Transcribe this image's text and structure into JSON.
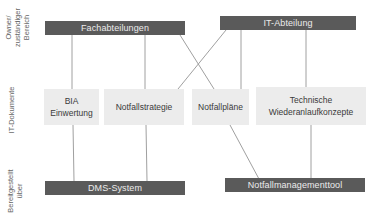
{
  "side_labels": {
    "owner": [
      "Owner/",
      "zuständiger",
      "Bereich"
    ],
    "documents": "IT-Dokumente",
    "provided": [
      "Bereitgestellt",
      "über"
    ]
  },
  "owners": {
    "fachabteilungen": "Fachabteilungen",
    "it_abteilung": "IT-Abteilung"
  },
  "documents": {
    "bia": [
      "BIA",
      "Einwertung"
    ],
    "notfallstrategie": "Notfallstrategie",
    "notfallplaene": "Notfallpläne",
    "technische": [
      "Technische",
      "Wiederanlaufkonzepte"
    ]
  },
  "systems": {
    "dms": "DMS-System",
    "tool": "Notfallmanagementtool"
  },
  "colors": {
    "bar": "#5a5a5a",
    "bar_text": "#ececec",
    "box": "#ececec",
    "line": "#9a9a9a"
  }
}
